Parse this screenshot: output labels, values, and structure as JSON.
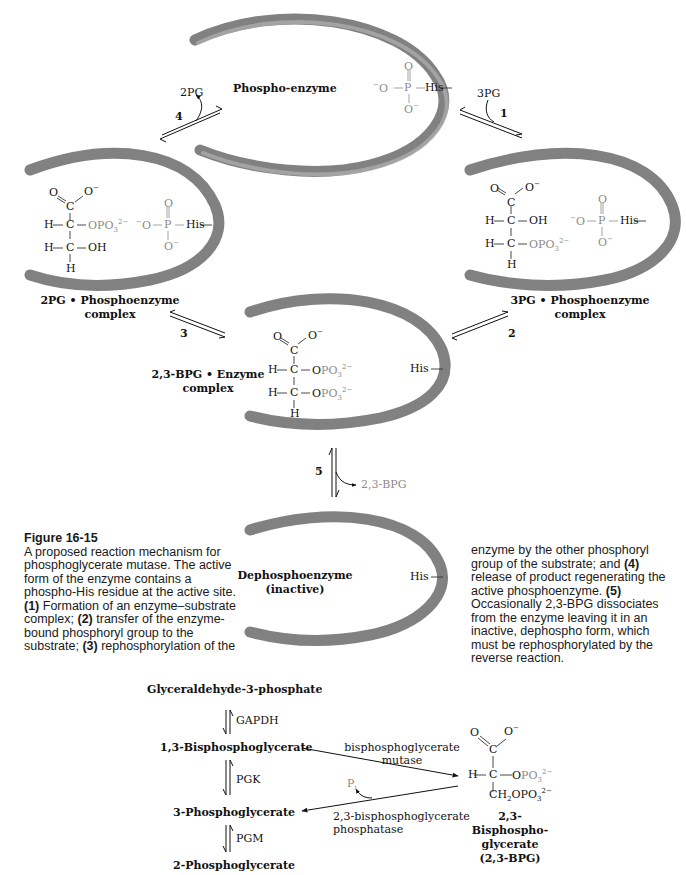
{
  "figure": {
    "number": "Figure 16-15",
    "caption_left": [
      {
        "t": "A proposed reaction mechanism for phosphoglycerate mutase. The active form of the enzyme contains a phospho-His residue at the active site. "
      },
      {
        "b": "(1)"
      },
      {
        "t": " Formation of an enzyme–substrate complex; "
      },
      {
        "b": "(2)"
      },
      {
        "t": " transfer of the enzyme-bound phosphoryl group to the substrate; "
      },
      {
        "b": "(3)"
      },
      {
        "t": " rephosphorylation of the"
      }
    ],
    "caption_right_parts": {
      "p1": "enzyme by the other phosphoryl group of the substrate; and ",
      "b4": "(4)",
      "p2": " release of product regenerating the active phosphoenzyme. ",
      "b5": "(5)",
      "p3": " Occasionally 2,3-BPG dissociates from the enzyme leaving it in an inactive, dephospho form, which must be rephosphorylated by the reverse reaction."
    }
  },
  "mechanism": {
    "states": {
      "phospho_enzyme": {
        "label": "Phospho-enzyme"
      },
      "pg2_complex": {
        "label_line1": "2PG • Phosphoenzyme",
        "label_line2": "complex"
      },
      "pg3_complex": {
        "label_line1": "3PG • Phosphoenzyme",
        "label_line2": "complex"
      },
      "bpg_complex": {
        "label_line1": "2,3-BPG • Enzyme",
        "label_line2": "complex"
      },
      "dephospho": {
        "label_line1": "Dephosphoenzyme",
        "label_line2": "(inactive)"
      }
    },
    "steps": [
      {
        "number": "1",
        "species": "3PG",
        "direction": "in"
      },
      {
        "number": "2"
      },
      {
        "number": "3"
      },
      {
        "number": "4",
        "species": "2PG",
        "direction": "out"
      },
      {
        "number": "5",
        "species": "2,3-BPG",
        "direction": "out"
      }
    ],
    "chem": {
      "his": "His",
      "o_minus": "O",
      "o": "O",
      "p": "P",
      "c": "C",
      "h": "H",
      "oh": "OH",
      "opo3": "OPO",
      "sub3": "3",
      "sup2m": "2−",
      "minus": "−",
      "ch2opo3": "CH",
      "sub2": "2"
    }
  },
  "pathway": {
    "metabolites": [
      "Glyceraldehyde-3-phosphate",
      "1,3-Bisphosphoglycerate",
      "3-Phosphoglycerate",
      "2-Phosphoglycerate"
    ],
    "enzymes": [
      "GAPDH",
      "PGK",
      "PGM"
    ],
    "shunt": {
      "mutase_line1": "bisphosphoglycerate",
      "mutase_line2": "mutase",
      "phosphatase_line1": "2,3-bisphosphoglycerate",
      "phosphatase_line2": "phosphatase",
      "pi": "P",
      "pi_sub": "i",
      "product_line1": "2,3-Bisphospho-",
      "product_line2": "glycerate",
      "product_line3": "(2,3-BPG)"
    }
  },
  "colors": {
    "text": "#111111",
    "grey_text": "#8a8a8a",
    "shell_dark": "#5a5a5a",
    "shell_light": "#d8d8d8"
  }
}
